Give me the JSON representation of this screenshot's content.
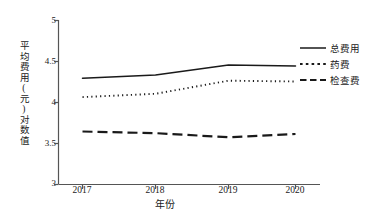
{
  "chart_data": {
    "type": "line",
    "title": "",
    "xlabel": "年份",
    "ylabel": "平均费用(元)对数值",
    "categories": [
      "2017",
      "2018",
      "2019",
      "2020"
    ],
    "x": [
      2017,
      2018,
      2019,
      2020
    ],
    "xlim": [
      2016.6,
      2020.8
    ],
    "ylim": [
      3,
      5
    ],
    "yticks": [
      "3",
      "3.5",
      "4",
      "4.5",
      "5"
    ],
    "ytick_values": [
      3,
      3.5,
      4,
      4.5,
      5
    ],
    "grid": false,
    "legend_position": "right",
    "series": [
      {
        "name": "总费用",
        "style": "solid",
        "color": "#1a1a1a",
        "values": [
          4.29,
          4.33,
          4.45,
          4.44
        ]
      },
      {
        "name": "药费",
        "style": "dotted",
        "color": "#1a1a1a",
        "values": [
          4.06,
          4.1,
          4.26,
          4.25
        ]
      },
      {
        "name": "检查费",
        "style": "dashed",
        "color": "#1a1a1a",
        "values": [
          3.64,
          3.62,
          3.57,
          3.61
        ]
      }
    ]
  },
  "axis": {
    "line_color": "#555555"
  }
}
